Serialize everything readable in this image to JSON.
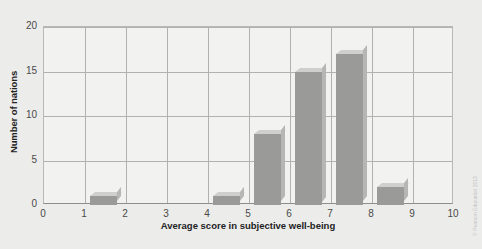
{
  "chart_data": {
    "type": "bar",
    "title": "",
    "subtitle": "",
    "xlabel": "Average score in subjective well-being",
    "ylabel": "Number of nations",
    "xlim": [
      0,
      10
    ],
    "ylim": [
      0,
      20
    ],
    "xticks": [
      "0",
      "1",
      "2",
      "3",
      "4",
      "5",
      "6",
      "7",
      "8",
      "9",
      "10"
    ],
    "yticks": [
      "0",
      "5",
      "10",
      "15",
      "20"
    ],
    "grid": "both",
    "legend": "none",
    "bin_width": 1,
    "categories": [
      "0-1",
      "1-2",
      "2-3",
      "3-4",
      "4-5",
      "5-6",
      "6-7",
      "7-8",
      "8-9",
      "9-10"
    ],
    "values": [
      0,
      1,
      0,
      0,
      1,
      8,
      15,
      17,
      2,
      0
    ],
    "bins": [
      {
        "label": "1-2",
        "start": 1,
        "end": 2,
        "value": 1
      },
      {
        "label": "4-5",
        "start": 4,
        "end": 5,
        "value": 1
      },
      {
        "label": "5-6",
        "start": 5,
        "end": 6,
        "value": 8
      },
      {
        "label": "6-7",
        "start": 6,
        "end": 7,
        "value": 15
      },
      {
        "label": "7-8",
        "start": 7,
        "end": 8,
        "value": 17
      },
      {
        "label": "8-9",
        "start": 8,
        "end": 9,
        "value": 2
      }
    ],
    "colors": {
      "bar_face": "#9a9a98",
      "bar_top": "#cfcfcd",
      "bar_side": "#b6b6b4",
      "plot_background": "#f2f2f1",
      "figure_background": "#ececeb",
      "gridline": "#b1b1af",
      "axis": "#8d8d8b",
      "text": "#23231f"
    }
  },
  "credit": {
    "text": "© Pearson Education 2013"
  }
}
